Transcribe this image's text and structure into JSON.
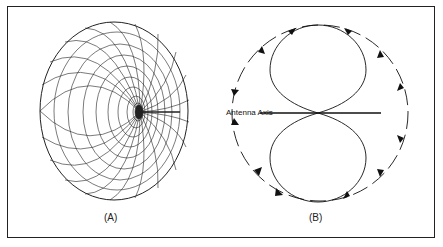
{
  "figure": {
    "panel_a": {
      "label": "(A)",
      "description": "3D doughnut radiation pattern"
    },
    "panel_b": {
      "label": "(B)",
      "description": "2D figure-eight cross-section"
    },
    "axis_label": "Antenna Axis"
  }
}
